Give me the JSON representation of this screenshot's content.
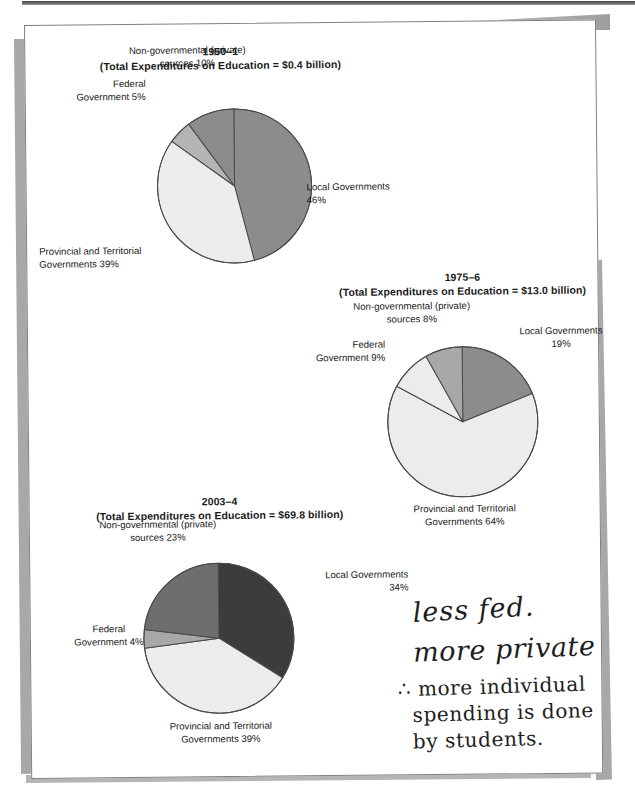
{
  "page": {
    "background_color": "#ffffff",
    "sheet_color": "#ffffff",
    "sheet_border_color": "#808080",
    "shadow_color": "#a8a8a8"
  },
  "palette": {
    "local_governments": "#8c8c8c",
    "provincial_territorial": "#ececec",
    "federal_government": "#b4b4b4",
    "non_governmental": "#8c8c8c",
    "dark_slice": "#3c3c3c",
    "medium_slice": "#6e6e6e",
    "outline": "#4a4a4a",
    "text": "#1a1a1a"
  },
  "chart_data": [
    {
      "type": "pie",
      "id": "chart-1950-1",
      "title": "1950–1",
      "subtitle": "(Total Expenditures on Education = $0.4 billion)",
      "total_label": "Total Expenditures on Education = $0.4 billion",
      "total_value": 0.4,
      "total_units": "billion dollars",
      "categories": [
        "Local Governments",
        "Provincial and Territorial Governments",
        "Federal Government",
        "Non-governmental (private) sources"
      ],
      "values": [
        46,
        39,
        5,
        10
      ],
      "value_suffix": "%",
      "colors": [
        "#8c8c8c",
        "#ececec",
        "#b4b4b4",
        "#8c8c8c"
      ],
      "labels": [
        {
          "text_line1": "Local Governments",
          "text_line2": "46%",
          "position": "right"
        },
        {
          "text_line1": "Provincial and Territorial",
          "text_line2": "Governments 39%",
          "position": "bottom-left"
        },
        {
          "text_line1": "Federal",
          "text_line2": "Government 5%",
          "position": "left"
        },
        {
          "text_line1": "Non-governmental (private)",
          "text_line2": "sources 10%",
          "position": "top"
        }
      ]
    },
    {
      "type": "pie",
      "id": "chart-1975-6",
      "title": "1975–6",
      "subtitle": "(Total Expenditures on Education = $13.0 billion)",
      "total_label": "Total Expenditures on Education = $13.0 billion",
      "total_value": 13.0,
      "total_units": "billion dollars",
      "categories": [
        "Local Governments",
        "Provincial and Territorial Governments",
        "Federal Government",
        "Non-governmental (private) sources"
      ],
      "values": [
        19,
        64,
        9,
        8
      ],
      "value_suffix": "%",
      "colors": [
        "#8c8c8c",
        "#ececec",
        "#ececec",
        "#a8a8a8"
      ],
      "labels": [
        {
          "text_line1": "Local Governments",
          "text_line2": "19%",
          "position": "right"
        },
        {
          "text_line1": "Provincial and Territorial",
          "text_line2": "Governments 64%",
          "position": "bottom"
        },
        {
          "text_line1": "Federal",
          "text_line2": "Government 9%",
          "position": "left"
        },
        {
          "text_line1": "Non-governmental (private)",
          "text_line2": "sources 8%",
          "position": "top"
        }
      ]
    },
    {
      "type": "pie",
      "id": "chart-2003-4",
      "title": "2003–4",
      "subtitle": "(Total Expenditures on Education = $69.8 billion)",
      "total_label": "Total Expenditures on Education = $69.8 billion",
      "total_value": 69.8,
      "total_units": "billion dollars",
      "categories": [
        "Local Governments",
        "Provincial and Territorial Governments",
        "Federal Government",
        "Non-governmental (private) sources"
      ],
      "values": [
        34,
        39,
        4,
        23
      ],
      "value_suffix": "%",
      "colors": [
        "#3c3c3c",
        "#ececec",
        "#a8a8a8",
        "#6e6e6e"
      ],
      "labels": [
        {
          "text_line1": "Local Governments",
          "text_line2": "34%",
          "position": "right"
        },
        {
          "text_line1": "Provincial and Territorial",
          "text_line2": "Governments 39%",
          "position": "bottom"
        },
        {
          "text_line1": "Federal",
          "text_line2": "Government 4%",
          "position": "left"
        },
        {
          "text_line1": "Non-governmental (private)",
          "text_line2": "sources 23%",
          "position": "top-left"
        }
      ]
    }
  ],
  "annotations": {
    "handwritten_note": {
      "lines": [
        "less fed.",
        "more private",
        "∴ more individual",
        "spending is done",
        "by students."
      ]
    }
  }
}
